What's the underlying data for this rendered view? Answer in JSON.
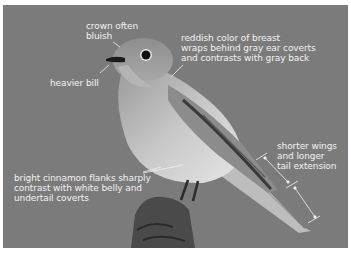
{
  "image": {
    "subject": "bird perched on stump, grayscale",
    "background_color": "#7b7b7b",
    "frame_color": "#ffffff"
  },
  "annotations": [
    {
      "id": "crown",
      "text": "crown often\nbluish"
    },
    {
      "id": "bill",
      "text": "heavier bill"
    },
    {
      "id": "breast",
      "text": "reddish color of breast\nwraps behind gray ear coverts\nand contrasts with gray back"
    },
    {
      "id": "wings",
      "text": "shorter wings\nand longer\ntail extension"
    },
    {
      "id": "flanks",
      "text": "bright cinnamon flanks sharply\ncontrast with white belly and\nundertail coverts"
    }
  ]
}
